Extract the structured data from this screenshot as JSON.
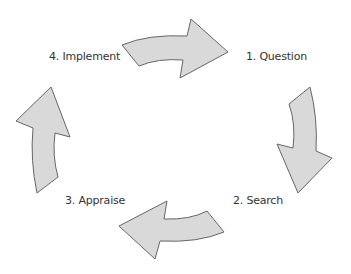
{
  "diagram": {
    "type": "cycle",
    "colors": {
      "arrow_fill": "#d9d9d9",
      "arrow_stroke": "#666666",
      "text": "#333333",
      "background": "#ffffff"
    },
    "steps": [
      {
        "label": "1. Question"
      },
      {
        "label": "2. Search"
      },
      {
        "label": "3. Appraise"
      },
      {
        "label": "4. Implement"
      }
    ],
    "arrows": [
      {
        "from": "4. Implement",
        "to": "1. Question",
        "direction": "right"
      },
      {
        "from": "1. Question",
        "to": "2. Search",
        "direction": "down"
      },
      {
        "from": "2. Search",
        "to": "3. Appraise",
        "direction": "left"
      },
      {
        "from": "3. Appraise",
        "to": "4. Implement",
        "direction": "up"
      }
    ]
  }
}
